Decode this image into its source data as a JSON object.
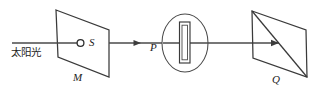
{
  "figure": {
    "type": "optics-ray-diagram",
    "title": "",
    "width": 316,
    "height": 91,
    "background_color": "#ffffff",
    "line_color": "#3a3a3a"
  },
  "labels": {
    "sunlight": "太阳光",
    "slit_source": "S",
    "screen_m": "M",
    "prism_holder": "P",
    "screen_q": "Q"
  },
  "components": [
    {
      "name": "sunlight-ray",
      "kind": "ray",
      "label": "太阳光",
      "description": "incoming horizontal light ray from the left"
    },
    {
      "name": "screen-m",
      "kind": "parallelogram-panel",
      "label": "M",
      "description": "first screen with a pinhole aperture S"
    },
    {
      "name": "pinhole-s",
      "kind": "small-circle",
      "label": "S",
      "description": "pinhole / point light source on screen M"
    },
    {
      "name": "element-p",
      "kind": "ellipse-with-slit",
      "label": "P",
      "description": "circular holder containing a narrow vertical slit"
    },
    {
      "name": "screen-q",
      "kind": "parallelogram-panel",
      "label": "Q",
      "description": "observation screen with diagonal"
    }
  ],
  "geometry": {
    "screen_m_points": "56,10 109,30 109,77 58,57",
    "screen_q_points": "252,11 306,30 307,77 253,58",
    "screen_q_diagonal": "252,11 307,77",
    "ellipse_p": {
      "cx": 185,
      "cy": 43,
      "rx": 23,
      "ry": 29
    },
    "pinhole": {
      "cx": 80.5,
      "cy": 43,
      "r": 3.4
    },
    "slit_outer": {
      "x": 179.5,
      "y": 22,
      "w": 10.5,
      "h": 41
    },
    "slit_inner": {
      "x": 182,
      "y": 25,
      "w": 5.5,
      "h": 35
    },
    "ray_segments": [
      {
        "name": "ray-in",
        "x1": 12,
        "y1": 43,
        "x2": 80,
        "y2": 43
      },
      {
        "name": "ray-m-to-p",
        "x1": 109,
        "y1": 43,
        "x2": 163,
        "y2": 43
      },
      {
        "name": "ray-p-to-q",
        "x1": 208,
        "y1": 43,
        "x2": 279,
        "y2": 43
      }
    ],
    "arrowheads": [
      {
        "name": "arrow-m-to-p",
        "tip_x": 141,
        "tip_y": 43
      },
      {
        "name": "arrow-into-q",
        "tip_x": 279,
        "tip_y": 43
      }
    ]
  }
}
